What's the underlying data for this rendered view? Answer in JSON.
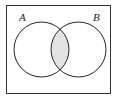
{
  "diagram": {
    "type": "venn",
    "sets": [
      {
        "label": "A",
        "cx": 41.5,
        "cy": 49.5,
        "r": 27.5
      },
      {
        "label": "B",
        "cx": 78.5,
        "cy": 49.5,
        "r": 27.5
      }
    ],
    "shaded_region": "A ∩ B",
    "colors": {
      "stroke": "#222222",
      "shade": "#e3e3e3",
      "background": "#ffffff"
    }
  }
}
